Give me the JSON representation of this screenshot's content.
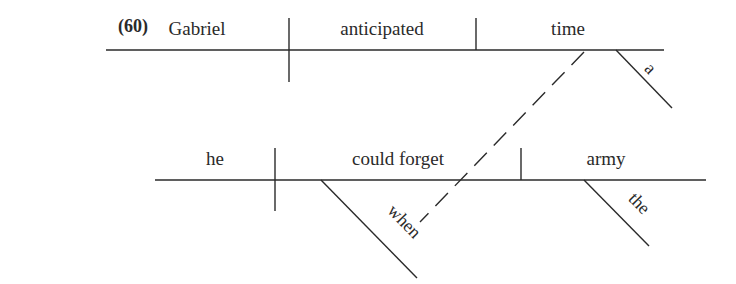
{
  "example_number": "(60)",
  "main_clause": {
    "subject": "Gabriel",
    "verb": "anticipated",
    "object": "time",
    "object_modifier": "a"
  },
  "relative_clause": {
    "subject": "he",
    "verb": "could forget",
    "object": "army",
    "object_modifier": "the",
    "adverbial_modifier": "when"
  },
  "colors": {
    "line": "#2a2a2a",
    "background": "#ffffff"
  }
}
